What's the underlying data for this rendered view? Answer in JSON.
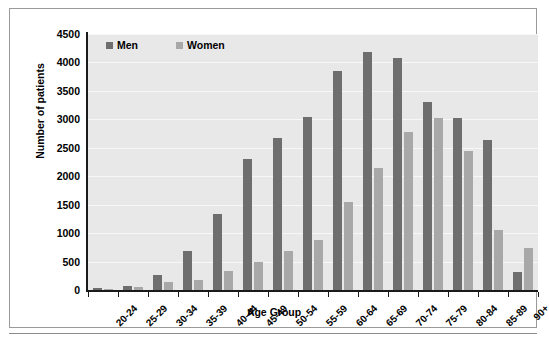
{
  "figure": {
    "background_color": "#ffffff",
    "frame_color": "#9a9a9a",
    "caption_partial": ""
  },
  "legend": {
    "position": "top-left-inside",
    "items": [
      {
        "label": "Men",
        "color": "#6e6e6e",
        "swatch_name": "men-swatch"
      },
      {
        "label": "Women",
        "color": "#a8a8a8",
        "swatch_name": "women-swatch"
      }
    ]
  },
  "axes": {
    "y_title": "Number of patients",
    "x_title": "Age Group",
    "y_ticks": [
      "0",
      "500",
      "1000",
      "1500",
      "2000",
      "2500",
      "3000",
      "3500",
      "4000",
      "4500"
    ],
    "plot_background": "#e8e8e8",
    "gridline_color": "#f7f7f7",
    "axis_line_color": "#1a1a1a"
  },
  "chart_data": {
    "type": "bar",
    "title": "",
    "xlabel": "Age Group",
    "ylabel": "Number of patients",
    "ylim": [
      0,
      4500
    ],
    "ytick_step": 500,
    "grid": true,
    "legend_position": "upper left",
    "categories": [
      "20-24",
      "25-29",
      "30-34",
      "35-39",
      "40-44",
      "45-49",
      "50-54",
      "55-59",
      "60-64",
      "65-69",
      "70-74",
      "75-79",
      "80-84",
      "85-89",
      "90+"
    ],
    "series": [
      {
        "name": "Men",
        "color": "#6e6e6e",
        "values": [
          30,
          70,
          270,
          680,
          1340,
          2300,
          2680,
          3040,
          3850,
          4180,
          4080,
          3300,
          3020,
          2640,
          310
        ]
      },
      {
        "name": "Women",
        "color": "#a8a8a8",
        "values": [
          20,
          50,
          140,
          180,
          330,
          490,
          690,
          880,
          1540,
          2150,
          2780,
          3030,
          2450,
          1060,
          740
        ]
      }
    ]
  }
}
